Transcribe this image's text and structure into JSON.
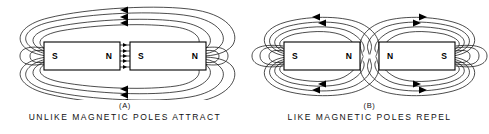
{
  "figure": {
    "background_color": "#ffffff",
    "line_color": "#111111",
    "panels": [
      {
        "key": "(A)",
        "caption": "UNLIKE MAGNETIC POLES ATTRACT",
        "magnets": [
          {
            "left_pole": "S",
            "right_pole": "N"
          },
          {
            "left_pole": "S",
            "right_pole": "N"
          }
        ],
        "field_direction": "left",
        "gap_arrow_direction": "right",
        "gap_line_count": 5,
        "loop_count": 4,
        "arrow_rows": 3
      },
      {
        "key": "(B)",
        "caption": "LIKE MAGNETIC POLES REPEL",
        "magnets": [
          {
            "left_pole": "S",
            "right_pole": "N"
          },
          {
            "left_pole": "N",
            "right_pole": "S"
          }
        ],
        "field_direction_left_magnet": "left",
        "field_direction_right_magnet": "right",
        "gap_line_count": 0,
        "loop_count": 4,
        "arrow_rows": 2
      }
    ],
    "labels": {
      "north": "N",
      "south": "S"
    }
  }
}
